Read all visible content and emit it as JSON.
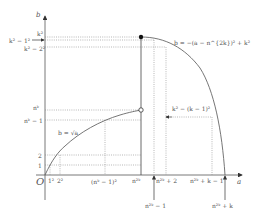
{
  "diagram": {
    "axes": {
      "x_label": "a",
      "y_label": "b",
      "origin_label": "O"
    },
    "curves": [
      {
        "name": "sqrt-curve",
        "equation": "b = √a"
      },
      {
        "name": "parabola-curve",
        "equation": "b = −(a − n^{2k})² + k²"
      }
    ],
    "y_ticks": {
      "k2": "k²",
      "k2_minus_1": "k² − 1²",
      "k2_minus_2": "k² − 2²",
      "nk": "nᵏ",
      "nk_minus_1": "nᵏ − 1",
      "two": "2",
      "one": "1"
    },
    "x_ticks": {
      "one_sq": "1²",
      "two_sq": "2²",
      "nk_minus_1_sq": "(nᵏ − 1)²",
      "n2k": "n²ᵏ",
      "n2k_minus_1": "n²ᵏ − 1",
      "n2k_plus_2": "n²ᵏ + 2",
      "n2k_plus_k_minus_1": "n²ᵏ + k − 1",
      "n2k_plus_k": "n²ᵏ + k"
    },
    "annotations": {
      "parabola_value": "k² − (k − 1)²"
    },
    "colors": {
      "axis": "#555555",
      "curve": "#666666",
      "dotted": "#888888",
      "background": "#ffffff"
    }
  }
}
